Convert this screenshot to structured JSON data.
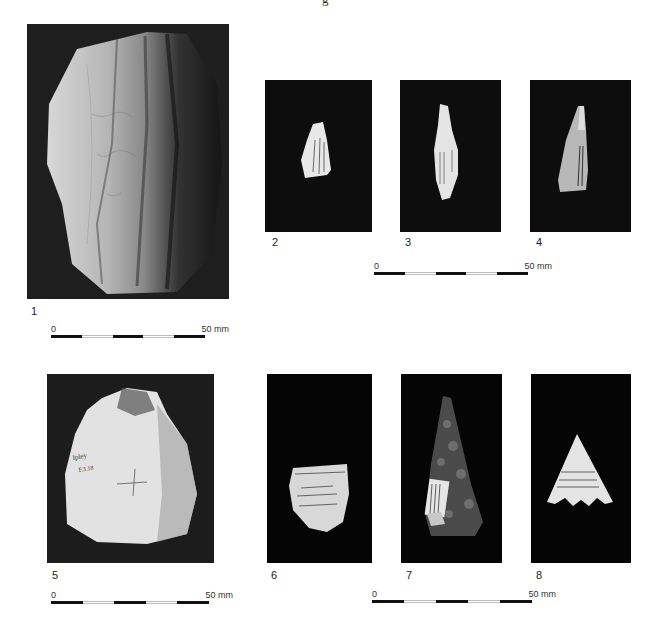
{
  "page": {
    "top_mark": "g",
    "background": "#ffffff"
  },
  "figures": [
    {
      "id": "1",
      "label": "1",
      "subject": "flint core",
      "photo_bg": "#1a1a1a"
    },
    {
      "id": "2",
      "label": "2",
      "subject": "blade fragment with label",
      "photo_bg": "#0d0d0d"
    },
    {
      "id": "3",
      "label": "3",
      "subject": "blade with label",
      "photo_bg": "#0d0d0d"
    },
    {
      "id": "4",
      "label": "4",
      "subject": "pointed blade with label",
      "photo_bg": "#0d0d0d"
    },
    {
      "id": "5",
      "label": "5",
      "subject": "flint nodule",
      "photo_bg": "#1a1a1a"
    },
    {
      "id": "6",
      "label": "6",
      "subject": "flake with label",
      "photo_bg": "#050505"
    },
    {
      "id": "7",
      "label": "7",
      "subject": "bifacial point with label",
      "photo_bg": "#050505"
    },
    {
      "id": "8",
      "label": "8",
      "subject": "barbed arrowhead with label",
      "photo_bg": "#050505"
    }
  ],
  "scale_bars": [
    {
      "id": "scale-1",
      "zero_label": "0",
      "max_label": "50 mm",
      "segments": 5
    },
    {
      "id": "scale-2-4",
      "zero_label": "0",
      "max_label": "50 mm",
      "segments": 5
    },
    {
      "id": "scale-5",
      "zero_label": "0",
      "max_label": "50 mm",
      "segments": 5
    },
    {
      "id": "scale-6-8",
      "zero_label": "0",
      "max_label": "50 mm",
      "segments": 5
    }
  ]
}
